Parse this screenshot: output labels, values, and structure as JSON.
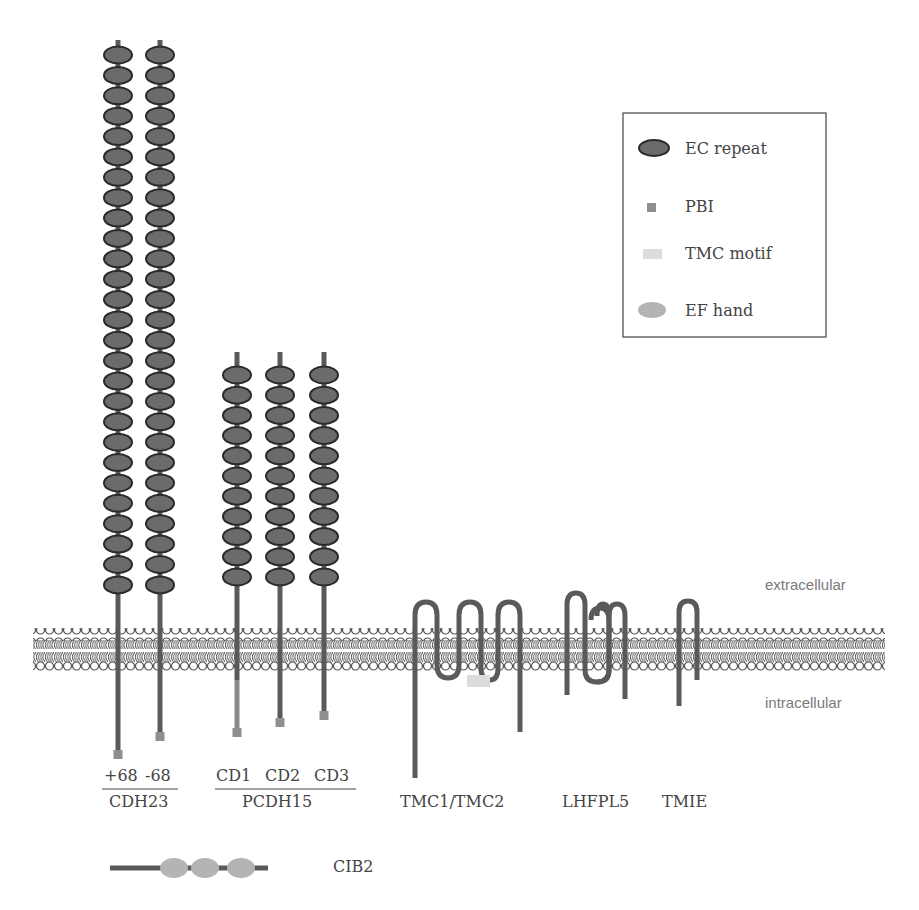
{
  "legend": {
    "items": [
      {
        "label": "EC repeat",
        "icon": "ec-repeat-ellipse",
        "color": "#6b6b6b"
      },
      {
        "label": "PBI",
        "icon": "pbi-square",
        "color": "#8f8f8f"
      },
      {
        "label": "TMC motif",
        "icon": "tmc-motif-rect",
        "color": "#dcdcdc"
      },
      {
        "label": "EF hand",
        "icon": "ef-hand-ellipse",
        "color": "#b4b4b4"
      }
    ]
  },
  "regions": {
    "extracellular": "extracellular",
    "intracellular": "intracellular"
  },
  "proteins": {
    "cdh23": {
      "name": "CDH23",
      "isoforms": [
        "+68",
        "-68"
      ],
      "ec_repeats": 27
    },
    "pcdh15": {
      "name": "PCDH15",
      "isoforms": [
        "CD1",
        "CD2",
        "CD3"
      ],
      "ec_repeats": 11
    },
    "tmc": {
      "name": "TMC1/TMC2"
    },
    "lhfpl5": {
      "name": "LHFPL5"
    },
    "tmie": {
      "name": "TMIE"
    },
    "cib2": {
      "name": "CIB2",
      "ef_hands": 3
    }
  },
  "colors": {
    "protein": "#5a5a5a",
    "ec_fill": "#6b6b6b",
    "ec_stroke": "#2a2a2a",
    "pbi": "#8f8f8f",
    "tmc_motif": "#dcdcdc",
    "ef_hand": "#b4b4b4",
    "membrane": "#555555"
  }
}
